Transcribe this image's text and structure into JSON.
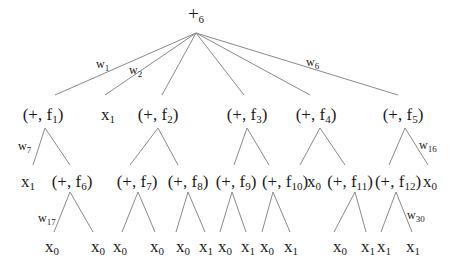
{
  "diagram": {
    "root": {
      "op": "+",
      "index": "6"
    },
    "nodes": [
      {
        "id": "n_f1",
        "kind": "pair",
        "op": "+",
        "fn": "f",
        "idx": "1"
      },
      {
        "id": "n_x1a",
        "kind": "var",
        "var": "x",
        "idx": "1"
      },
      {
        "id": "n_f2",
        "kind": "pair",
        "op": "+",
        "fn": "f",
        "idx": "2"
      },
      {
        "id": "n_f3",
        "kind": "pair",
        "op": "+",
        "fn": "f",
        "idx": "3"
      },
      {
        "id": "n_f4",
        "kind": "pair",
        "op": "+",
        "fn": "f",
        "idx": "4"
      },
      {
        "id": "n_f5",
        "kind": "pair",
        "op": "+",
        "fn": "f",
        "idx": "5"
      },
      {
        "id": "n_x1b",
        "kind": "var",
        "var": "x",
        "idx": "1"
      },
      {
        "id": "n_f6",
        "kind": "pair",
        "op": "+",
        "fn": "f",
        "idx": "6"
      },
      {
        "id": "n_f7",
        "kind": "pair",
        "op": "+",
        "fn": "f",
        "idx": "7"
      },
      {
        "id": "n_f8",
        "kind": "pair",
        "op": "+",
        "fn": "f",
        "idx": "8"
      },
      {
        "id": "n_f9",
        "kind": "pair",
        "op": "+",
        "fn": "f",
        "idx": "9"
      },
      {
        "id": "n_f10",
        "kind": "pair",
        "op": "+",
        "fn": "f",
        "idx": "10"
      },
      {
        "id": "n_x0a",
        "kind": "var",
        "var": "x",
        "idx": "0"
      },
      {
        "id": "n_f11",
        "kind": "pair",
        "op": "+",
        "fn": "f",
        "idx": "11"
      },
      {
        "id": "n_f12",
        "kind": "pair",
        "op": "+",
        "fn": "f",
        "idx": "12"
      },
      {
        "id": "n_x0b",
        "kind": "var",
        "var": "x",
        "idx": "0"
      },
      {
        "id": "l_f6a",
        "kind": "var",
        "var": "x",
        "idx": "0"
      },
      {
        "id": "l_f6b",
        "kind": "var",
        "var": "x",
        "idx": "0"
      },
      {
        "id": "l_f7a",
        "kind": "var",
        "var": "x",
        "idx": "0"
      },
      {
        "id": "l_f7b",
        "kind": "var",
        "var": "x",
        "idx": "0"
      },
      {
        "id": "l_f8a",
        "kind": "var",
        "var": "x",
        "idx": "0"
      },
      {
        "id": "l_f8b",
        "kind": "var",
        "var": "x",
        "idx": "1"
      },
      {
        "id": "l_f9a",
        "kind": "var",
        "var": "x",
        "idx": "0"
      },
      {
        "id": "l_f9b",
        "kind": "var",
        "var": "x",
        "idx": "1"
      },
      {
        "id": "l_f10a",
        "kind": "var",
        "var": "x",
        "idx": "0"
      },
      {
        "id": "l_f10b",
        "kind": "var",
        "var": "x",
        "idx": "1"
      },
      {
        "id": "l_f11a",
        "kind": "var",
        "var": "x",
        "idx": "0"
      },
      {
        "id": "l_f11b",
        "kind": "var",
        "var": "x",
        "idx": "1"
      },
      {
        "id": "l_f12a",
        "kind": "var",
        "var": "x",
        "idx": "1"
      },
      {
        "id": "l_f12b",
        "kind": "var",
        "var": "x",
        "idx": "1"
      }
    ],
    "edges": [
      {
        "from": "root",
        "to": "n_f1",
        "weight": "1"
      },
      {
        "from": "root",
        "to": "n_x1a",
        "weight": "2"
      },
      {
        "from": "root",
        "to": "n_f2"
      },
      {
        "from": "root",
        "to": "n_f3"
      },
      {
        "from": "root",
        "to": "n_f4"
      },
      {
        "from": "root",
        "to": "n_f5",
        "weight": "6"
      },
      {
        "from": "n_f1",
        "to": "n_x1b",
        "weight": "7"
      },
      {
        "from": "n_f1",
        "to": "n_f6"
      },
      {
        "from": "n_f2",
        "to": "n_f7"
      },
      {
        "from": "n_f2",
        "to": "n_f8"
      },
      {
        "from": "n_f3",
        "to": "n_f9"
      },
      {
        "from": "n_f3",
        "to": "n_f10"
      },
      {
        "from": "n_f4",
        "to": "n_x0a"
      },
      {
        "from": "n_f4",
        "to": "n_f11"
      },
      {
        "from": "n_f5",
        "to": "n_f12"
      },
      {
        "from": "n_f5",
        "to": "n_x0b",
        "weight": "16"
      },
      {
        "from": "n_f6",
        "to": "l_f6a",
        "weight": "17"
      },
      {
        "from": "n_f6",
        "to": "l_f6b"
      },
      {
        "from": "n_f7",
        "to": "l_f7a"
      },
      {
        "from": "n_f7",
        "to": "l_f7b"
      },
      {
        "from": "n_f8",
        "to": "l_f8a"
      },
      {
        "from": "n_f8",
        "to": "l_f8b"
      },
      {
        "from": "n_f9",
        "to": "l_f9a"
      },
      {
        "from": "n_f9",
        "to": "l_f9b"
      },
      {
        "from": "n_f10",
        "to": "l_f10a"
      },
      {
        "from": "n_f10",
        "to": "l_f10b"
      },
      {
        "from": "n_f11",
        "to": "l_f11a"
      },
      {
        "from": "n_f11",
        "to": "l_f11b"
      },
      {
        "from": "n_f12",
        "to": "l_f12a"
      },
      {
        "from": "n_f12",
        "to": "l_f12b",
        "weight": "30"
      }
    ],
    "weight_symbol": "w",
    "colors": {
      "line": "#8a8a8a",
      "text": "#1a1a1a"
    }
  }
}
